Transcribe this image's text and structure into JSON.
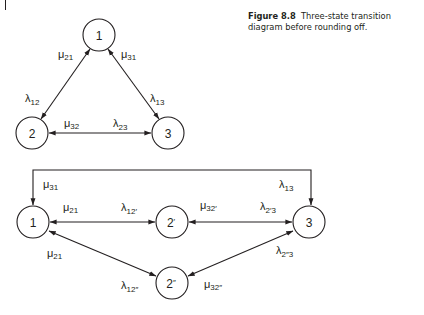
{
  "caption": {
    "figure_number": "Figure 8.8",
    "text": "Three-state transition diagram before rounding off."
  },
  "colors": {
    "ink": "#231f20",
    "background": "#ffffff"
  },
  "top_diagram": {
    "nodes": [
      {
        "id": "1",
        "label": "1"
      },
      {
        "id": "2",
        "label": "2"
      },
      {
        "id": "3",
        "label": "3"
      }
    ],
    "edges": [
      {
        "between": [
          "1",
          "2"
        ],
        "labels": {
          "mu": {
            "sym": "μ",
            "sub": "21"
          },
          "lambda": {
            "sym": "λ",
            "sub": "12"
          }
        }
      },
      {
        "between": [
          "1",
          "3"
        ],
        "labels": {
          "mu": {
            "sym": "μ",
            "sub": "31"
          },
          "lambda": {
            "sym": "λ",
            "sub": "13"
          }
        }
      },
      {
        "between": [
          "2",
          "3"
        ],
        "labels": {
          "mu": {
            "sym": "μ",
            "sub": "32"
          },
          "lambda": {
            "sym": "λ",
            "sub": "23"
          }
        }
      }
    ]
  },
  "bottom_diagram": {
    "nodes": [
      {
        "id": "1",
        "label": "1"
      },
      {
        "id": "2p",
        "label": "2",
        "mark": "′"
      },
      {
        "id": "2pp",
        "label": "2",
        "mark": "″"
      },
      {
        "id": "3",
        "label": "3"
      }
    ],
    "edges": [
      {
        "between": [
          "1",
          "3"
        ],
        "labels": {
          "mu": {
            "sym": "μ",
            "sub": "31"
          },
          "lambda": {
            "sym": "λ",
            "sub": "13"
          }
        }
      },
      {
        "between": [
          "1",
          "2p"
        ],
        "labels": {
          "mu": {
            "sym": "μ",
            "sub": "21"
          },
          "lambda": {
            "sym": "λ",
            "sub": "12′"
          }
        }
      },
      {
        "between": [
          "2p",
          "3"
        ],
        "labels": {
          "mu": {
            "sym": "μ",
            "sub": "32′"
          },
          "lambda": {
            "sym": "λ",
            "sub": "2′3"
          }
        }
      },
      {
        "between": [
          "1",
          "2pp"
        ],
        "labels": {
          "mu": {
            "sym": "μ",
            "sub": "21"
          },
          "lambda": {
            "sym": "λ",
            "sub": "12″"
          }
        }
      },
      {
        "between": [
          "2pp",
          "3"
        ],
        "labels": {
          "mu": {
            "sym": "μ",
            "sub": "32″"
          },
          "lambda": {
            "sym": "λ",
            "sub": "2″3"
          }
        }
      }
    ]
  }
}
